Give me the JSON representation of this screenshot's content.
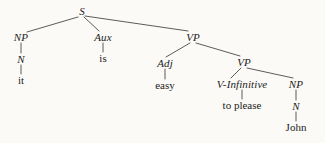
{
  "diagram": {
    "type": "syntax-tree",
    "sentence": "it is easy to please John",
    "background_color": "#fbfaf7",
    "line_color": "#4a4a4a",
    "text_color": "#1c1c1c",
    "nodes": [
      {
        "id": "S",
        "label": "S",
        "style": "italic",
        "x": 82,
        "y": 11
      },
      {
        "id": "NP1",
        "label": "NP",
        "style": "italic",
        "x": 21,
        "y": 37
      },
      {
        "id": "N1",
        "label": "N",
        "style": "italic",
        "x": 21,
        "y": 59
      },
      {
        "id": "it",
        "label": "it",
        "style": "roman",
        "x": 21,
        "y": 80
      },
      {
        "id": "Aux",
        "label": "Aux",
        "style": "italic",
        "x": 103,
        "y": 37
      },
      {
        "id": "is",
        "label": "is",
        "style": "roman",
        "x": 103,
        "y": 58
      },
      {
        "id": "VP1",
        "label": "VP",
        "style": "italic",
        "x": 193,
        "y": 37
      },
      {
        "id": "Adj",
        "label": "Adj",
        "style": "italic",
        "x": 165,
        "y": 63
      },
      {
        "id": "easy",
        "label": "easy",
        "style": "roman",
        "x": 165,
        "y": 85
      },
      {
        "id": "VP2",
        "label": "VP",
        "style": "italic",
        "x": 244,
        "y": 62
      },
      {
        "id": "VInf",
        "label": "V-Infinitive",
        "style": "italic",
        "x": 242,
        "y": 84
      },
      {
        "id": "to_please",
        "label": "to please",
        "style": "roman",
        "x": 242,
        "y": 105
      },
      {
        "id": "NP2",
        "label": "NP",
        "style": "italic",
        "x": 296,
        "y": 84
      },
      {
        "id": "N2",
        "label": "N",
        "style": "italic",
        "x": 296,
        "y": 106
      },
      {
        "id": "John",
        "label": "John",
        "style": "roman",
        "x": 296,
        "y": 127
      }
    ],
    "edges": [
      {
        "from": "S",
        "to": "NP1",
        "x1": 78,
        "y1": 17,
        "x2": 27,
        "y2": 32
      },
      {
        "from": "S",
        "to": "Aux",
        "x1": 84,
        "y1": 17,
        "x2": 99,
        "y2": 31
      },
      {
        "from": "S",
        "to": "VP1",
        "x1": 85,
        "y1": 16,
        "x2": 188,
        "y2": 31
      },
      {
        "from": "NP1",
        "to": "N1",
        "x1": 21,
        "y1": 43,
        "x2": 21,
        "y2": 53
      },
      {
        "from": "N1",
        "to": "it",
        "x1": 21,
        "y1": 65,
        "x2": 21,
        "y2": 74
      },
      {
        "from": "Aux",
        "to": "is",
        "x1": 103,
        "y1": 43,
        "x2": 103,
        "y2": 52
      },
      {
        "from": "VP1",
        "to": "Adj",
        "x1": 190,
        "y1": 43,
        "x2": 166,
        "y2": 57
      },
      {
        "from": "VP1",
        "to": "VP2",
        "x1": 196,
        "y1": 43,
        "x2": 240,
        "y2": 56
      },
      {
        "from": "Adj",
        "to": "easy",
        "x1": 165,
        "y1": 69,
        "x2": 165,
        "y2": 79
      },
      {
        "from": "VP2",
        "to": "VInf",
        "x1": 241,
        "y1": 68,
        "x2": 231,
        "y2": 78
      },
      {
        "from": "VP2",
        "to": "NP2",
        "x1": 247,
        "y1": 68,
        "x2": 293,
        "y2": 78
      },
      {
        "from": "VInf",
        "to": "to_please",
        "x1": 242,
        "y1": 90,
        "x2": 242,
        "y2": 99
      },
      {
        "from": "NP2",
        "to": "N2",
        "x1": 296,
        "y1": 90,
        "x2": 296,
        "y2": 100
      },
      {
        "from": "N2",
        "to": "John",
        "x1": 296,
        "y1": 112,
        "x2": 296,
        "y2": 121
      }
    ]
  }
}
